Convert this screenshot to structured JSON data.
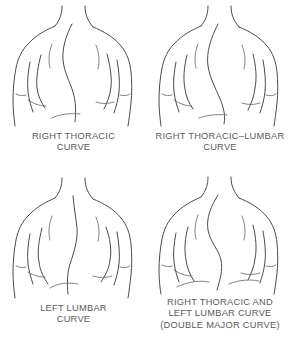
{
  "illustration": {
    "title": "Scoliosis curve patterns",
    "background_color": "#ffffff",
    "line_color": "#4a4a52",
    "caption_color": "#5a5a5a"
  },
  "figures": [
    {
      "id": "right-thoracic",
      "caption": "RIGHT THORACIC\nCURVE",
      "position": "top-left",
      "view": "posterior torso, female, arms at sides",
      "curve_side": "right",
      "curve_region": "thoracic"
    },
    {
      "id": "right-thoracic-lumbar",
      "caption": "RIGHT THORACIC–LUMBAR\nCURVE",
      "position": "top-right",
      "view": "posterior torso, female, arms at sides",
      "curve_side": "right",
      "curve_region": "thoracolumbar"
    },
    {
      "id": "left-lumbar",
      "caption": "LEFT LUMBAR\nCURVE",
      "position": "bottom-left",
      "view": "posterior torso, female, arms at sides",
      "curve_side": "left",
      "curve_region": "lumbar"
    },
    {
      "id": "double-major",
      "caption": "RIGHT THORACIC AND\nLEFT LUMBAR CURVE\n(DOUBLE MAJOR CURVE)",
      "position": "bottom-right",
      "view": "posterior torso, female, arms at sides",
      "curve_side": "both",
      "curve_region": "thoracic and lumbar"
    }
  ]
}
